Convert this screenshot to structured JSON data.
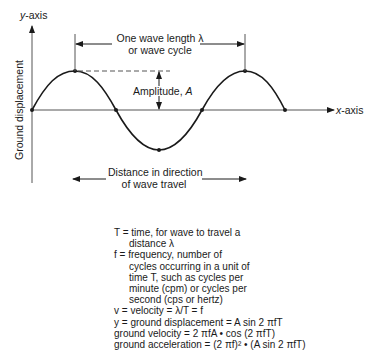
{
  "diagram": {
    "y_axis_label": "y-axis",
    "x_axis_label": "x-axis",
    "vertical_label": "Ground displacement",
    "wavelength_label_line1": "One wave length λ",
    "wavelength_label_line2": "or wave cycle",
    "amplitude_label": "Amplitude, A",
    "direction_label_line1": "Distance in direction",
    "direction_label_line2": "of wave travel"
  },
  "legend": {
    "lines": [
      "T = time, for wave to travel a",
      "distance λ",
      "f  = frequency, number of",
      "cycles occurring in a unit of",
      "time T, such as cycles per",
      "minute (cpm) or cycles per",
      "second (cps or hertz)",
      "v = velocity = λ/T = f",
      "y = ground displacement = A sin 2 πfT",
      "ground velocity = 2 πfA • cos (2 πfT)",
      "ground acceleration = (2 πf)² • (A sin 2 πfT)"
    ]
  },
  "colors": {
    "line": "#1a1a1a",
    "axis": "#555555",
    "background": "#ffffff"
  }
}
